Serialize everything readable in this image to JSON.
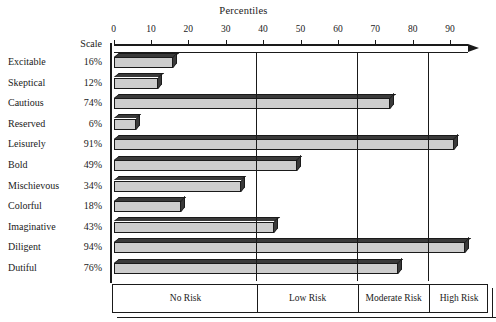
{
  "chart_data": {
    "type": "bar",
    "orientation": "horizontal",
    "title": "Percentiles",
    "xlabel": "Percentiles",
    "ylabel": "",
    "xlim": [
      0,
      100
    ],
    "grid": false,
    "legend_position": "bottom",
    "scale_header": "Scale",
    "ticks": [
      0,
      10,
      20,
      30,
      40,
      50,
      60,
      70,
      80,
      90
    ],
    "tick_labels": [
      "0",
      "10",
      "20",
      "30",
      "40",
      "50",
      "60",
      "70",
      "80",
      "90"
    ],
    "categories": [
      "Excitable",
      "Skeptical",
      "Cautious",
      "Reserved",
      "Leisurely",
      "Bold",
      "Mischievous",
      "Colorful",
      "Imaginative",
      "Diligent",
      "Dutiful"
    ],
    "values": [
      16,
      12,
      74,
      6,
      91,
      49,
      34,
      18,
      43,
      94,
      76
    ],
    "value_labels": [
      "16%",
      "12%",
      "74%",
      "6%",
      "91%",
      "49%",
      "34%",
      "18%",
      "43%",
      "94%",
      "76%"
    ],
    "bands": [
      {
        "label": "No Risk",
        "start": 0,
        "end": 38
      },
      {
        "label": "Low Risk",
        "start": 38,
        "end": 65
      },
      {
        "label": "Moderate Risk",
        "start": 65,
        "end": 84
      },
      {
        "label": "High Risk",
        "start": 84,
        "end": 100
      }
    ],
    "colors": {
      "bar_face": "#cdcdcd",
      "bar_shade": "#3a3a3a",
      "outline": "#1a1a1a",
      "background": "#ffffff"
    }
  }
}
